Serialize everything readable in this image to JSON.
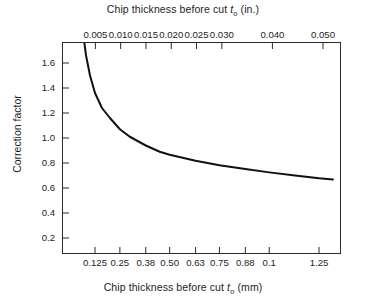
{
  "chart_data": {
    "type": "line",
    "title": "",
    "top_axis": {
      "label_prefix": "Chip thickness before cut",
      "label_symbol": "t",
      "label_subscript": "o",
      "label_units": "(in.)",
      "full_label": "Chip thickness before cut t_o (in.)",
      "tick_labels": [
        "0.005",
        "0.010",
        "0.015",
        "0.020",
        "0.025",
        "0.030",
        "0.040",
        "0.050"
      ],
      "tick_values": [
        0.005,
        0.01,
        0.015,
        0.02,
        0.025,
        0.03,
        0.04,
        0.05
      ]
    },
    "bottom_axis": {
      "label_prefix": "Chip thickness before cut",
      "label_symbol": "t",
      "label_subscript": "o",
      "label_units": "(mm)",
      "full_label": "Chip thickness before cut t_o (mm)",
      "tick_labels": [
        "0.125",
        "0.25",
        "0.38",
        "0.50",
        "0.63",
        "0.75",
        "0.88",
        "0.1",
        "1.25"
      ],
      "tick_values": [
        0.125,
        0.25,
        0.38,
        0.5,
        0.63,
        0.75,
        0.88,
        1.0,
        1.25
      ]
    },
    "ylabel": "Correction factor",
    "ytick_labels": [
      "1.6",
      "1.4",
      "1.2",
      "1.0",
      "0.8",
      "0.6",
      "0.4",
      "0.2"
    ],
    "ytick_values": [
      1.6,
      1.4,
      1.2,
      1.0,
      0.8,
      0.6,
      0.4,
      0.2
    ],
    "ylim": [
      0.0,
      1.84
    ],
    "xlim_mm": [
      0.0,
      1.375
    ],
    "grid": false,
    "legend": null,
    "series": [
      {
        "name": "Correction factor",
        "x": [
          0.065,
          0.08,
          0.1,
          0.125,
          0.16,
          0.2,
          0.25,
          0.3,
          0.38,
          0.45,
          0.5,
          0.63,
          0.75,
          0.88,
          1.0,
          1.13,
          1.25,
          1.32
        ],
        "values": [
          1.84,
          1.66,
          1.5,
          1.36,
          1.24,
          1.16,
          1.07,
          1.01,
          0.94,
          0.89,
          0.866,
          0.818,
          0.782,
          0.752,
          0.725,
          0.7,
          0.678,
          0.668
        ]
      }
    ],
    "curve_color": "#111111",
    "axis_color": "#2a2a2a",
    "background_color": "#ffffff"
  }
}
